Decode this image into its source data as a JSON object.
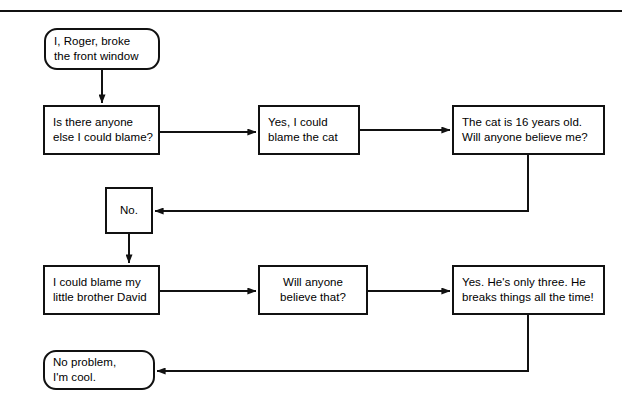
{
  "diagram": {
    "title_rule": "horizontal-divider",
    "canvas": {
      "width": 622,
      "height": 415
    },
    "stroke_color": "#111111",
    "fill_color": "#ffffff",
    "nodes": [
      {
        "id": "start",
        "shape": "terminal",
        "lines": [
          "I, Roger, broke",
          "the front window"
        ],
        "x": 44,
        "y": 28,
        "w": 116,
        "h": 42
      },
      {
        "id": "blame-question",
        "shape": "process",
        "lines": [
          "Is there anyone",
          "else I could blame?"
        ],
        "x": 43,
        "y": 105,
        "w": 117,
        "h": 50
      },
      {
        "id": "blame-cat",
        "shape": "process",
        "lines": [
          "Yes, I could",
          "blame the cat"
        ],
        "x": 258,
        "y": 105,
        "w": 102,
        "h": 50
      },
      {
        "id": "cat-age",
        "shape": "process",
        "lines": [
          "The cat is 16 years old.",
          "Will anyone believe me?"
        ],
        "x": 452,
        "y": 105,
        "w": 153,
        "h": 50
      },
      {
        "id": "no",
        "shape": "process",
        "lines": [
          "No."
        ],
        "x": 105,
        "y": 187,
        "w": 48,
        "h": 47
      },
      {
        "id": "blame-brother",
        "shape": "process",
        "lines": [
          "I could blame my",
          "little brother David"
        ],
        "x": 43,
        "y": 265,
        "w": 117,
        "h": 50
      },
      {
        "id": "believe-that",
        "shape": "process",
        "lines": [
          "Will anyone",
          "believe that?"
        ],
        "x": 258,
        "y": 265,
        "w": 110,
        "h": 50
      },
      {
        "id": "only-three",
        "shape": "process",
        "lines": [
          "Yes. He's only three. He",
          "breaks things all the time!"
        ],
        "x": 452,
        "y": 265,
        "w": 153,
        "h": 50
      },
      {
        "id": "no-problem",
        "shape": "terminal",
        "lines": [
          "No problem,",
          "I'm cool."
        ],
        "x": 43,
        "y": 350,
        "w": 112,
        "h": 40
      }
    ],
    "edges": [
      {
        "id": "start-to-question",
        "from": "start",
        "to": "blame-question",
        "kind": "vertical-arrow"
      },
      {
        "id": "question-to-cat",
        "from": "blame-question",
        "to": "blame-cat",
        "kind": "horizontal-arrow"
      },
      {
        "id": "cat-to-catage",
        "from": "blame-cat",
        "to": "cat-age",
        "kind": "horizontal-arrow"
      },
      {
        "id": "catage-to-no",
        "from": "cat-age",
        "to": "no",
        "kind": "loop-back-arrow"
      },
      {
        "id": "no-to-brother",
        "from": "no",
        "to": "blame-brother",
        "kind": "vertical-arrow"
      },
      {
        "id": "brother-to-believe",
        "from": "blame-brother",
        "to": "believe-that",
        "kind": "horizontal-arrow"
      },
      {
        "id": "believe-to-three",
        "from": "believe-that",
        "to": "only-three",
        "kind": "horizontal-arrow"
      },
      {
        "id": "three-to-noproblem",
        "from": "only-three",
        "to": "no-problem",
        "kind": "loop-back-arrow"
      }
    ]
  }
}
